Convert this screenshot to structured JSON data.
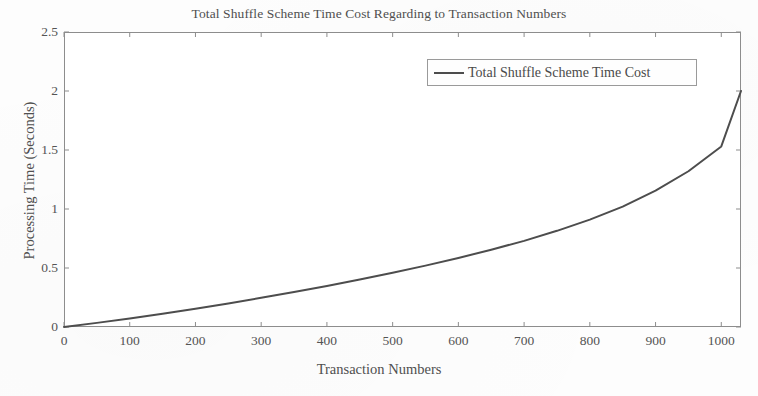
{
  "chart_data": {
    "type": "line",
    "title": "Total Shuffle Scheme Time Cost Regarding to Transaction Numbers",
    "xlabel": "Transaction Numbers",
    "ylabel": "Processing Time (Seconds)",
    "xlim": [
      0,
      1030
    ],
    "ylim": [
      0,
      2.5
    ],
    "xticks": [
      0,
      100,
      200,
      300,
      400,
      500,
      600,
      700,
      800,
      900,
      1000
    ],
    "xticklabels": [
      "0",
      "100",
      "200",
      "300",
      "400",
      "500",
      "600",
      "700",
      "800",
      "900",
      "1000"
    ],
    "yticks": [
      0,
      0.5,
      1,
      1.5,
      2,
      2.5
    ],
    "yticklabels": [
      "0",
      "0.5",
      "1",
      "1.5",
      "2",
      "2.5"
    ],
    "grid": false,
    "legend_position": "top-right",
    "series": [
      {
        "name": "Total Shuffle Scheme Time Cost",
        "color": "#4d4d4d",
        "x": [
          0,
          50,
          100,
          150,
          200,
          250,
          300,
          350,
          400,
          450,
          500,
          550,
          600,
          650,
          700,
          750,
          800,
          850,
          900,
          950,
          1000,
          1030
        ],
        "values": [
          0.0,
          0.035,
          0.073,
          0.113,
          0.155,
          0.2,
          0.247,
          0.296,
          0.348,
          0.402,
          0.46,
          0.52,
          0.585,
          0.655,
          0.73,
          0.815,
          0.91,
          1.02,
          1.155,
          1.32,
          1.53,
          2.0
        ]
      }
    ]
  },
  "legend": {
    "entries": [
      {
        "label": "Total Shuffle Scheme Time Cost"
      }
    ]
  }
}
